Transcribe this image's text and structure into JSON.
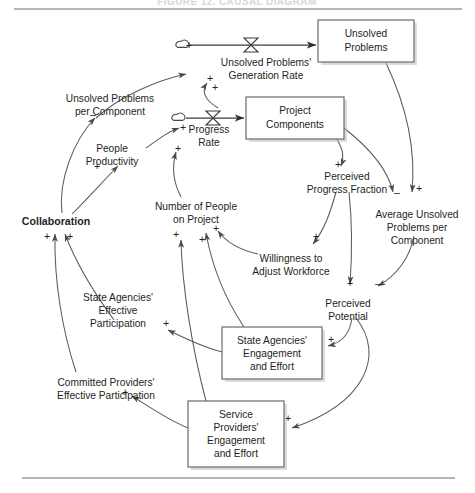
{
  "figure": {
    "title": "FIGURE 12. CAUSAL DIAGRAM",
    "top_rule": true,
    "bottom_rule": true,
    "type": "causal-loop-diagram"
  },
  "stocks": [
    {
      "id": "unsolved_problems",
      "lines": [
        "Unsolved",
        "Problems"
      ],
      "x": 318,
      "y": 20,
      "w": 96,
      "h": 42
    },
    {
      "id": "project_components",
      "lines": [
        "Project",
        "Components"
      ],
      "x": 246,
      "y": 97,
      "w": 98,
      "h": 42
    },
    {
      "id": "state_agencies_engagement",
      "lines": [
        "State Agencies'",
        "Engagement",
        "and Effort"
      ],
      "x": 222,
      "y": 327,
      "w": 100,
      "h": 52
    },
    {
      "id": "service_providers_engagement",
      "lines": [
        "Service",
        "Providers'",
        "Engagement",
        "and Effort"
      ],
      "x": 188,
      "y": 401,
      "w": 96,
      "h": 66
    }
  ],
  "flows": [
    {
      "id": "unsolved_problems_generation_rate",
      "lines": [
        "Unsolved Problems'",
        "Generation Rate"
      ],
      "label_x": 266,
      "label_y": 65,
      "cloud_x": 180,
      "cloud_y": 45,
      "valve_x": 251,
      "valve_y": 45,
      "target": "unsolved_problems"
    },
    {
      "id": "progress_rate",
      "lines": [
        "Progress",
        "Rate"
      ],
      "label_x": 209,
      "label_y": 132,
      "cloud_x": 176,
      "cloud_y": 118,
      "valve_x": 213,
      "valve_y": 118,
      "target": "project_components"
    }
  ],
  "variables": [
    {
      "id": "unsolved_problems_per_component",
      "lines": [
        "Unsolved Problems",
        "per Component"
      ],
      "x": 110,
      "y": 98,
      "bold": false
    },
    {
      "id": "people_productivity",
      "lines": [
        "People",
        "Productivity"
      ],
      "x": 112,
      "y": 148,
      "bold": false
    },
    {
      "id": "collaboration",
      "lines": [
        "Collaboration"
      ],
      "x": 56,
      "y": 221,
      "bold": true
    },
    {
      "id": "number_of_people_on_project",
      "lines": [
        "Number of People",
        "on Project"
      ],
      "x": 196,
      "y": 206,
      "bold": false
    },
    {
      "id": "willingness_to_adjust_workforce",
      "lines": [
        "Willingness to",
        "Adjust Workforce"
      ],
      "x": 291,
      "y": 258,
      "bold": false
    },
    {
      "id": "perceived_progress_fraction",
      "lines": [
        "Perceived",
        "Progress Fraction"
      ],
      "x": 347,
      "y": 176,
      "bold": false
    },
    {
      "id": "average_unsolved_problems_per_component",
      "lines": [
        "Average Unsolved",
        "Problems per",
        "Component"
      ],
      "x": 417,
      "y": 214,
      "bold": false
    },
    {
      "id": "perceived_potential",
      "lines": [
        "Perceived",
        "Potential"
      ],
      "x": 348,
      "y": 303,
      "bold": false
    },
    {
      "id": "state_agencies_effective_participation",
      "lines": [
        "State Agencies'",
        "Effective",
        "Participation"
      ],
      "x": 118,
      "y": 297,
      "bold": false
    },
    {
      "id": "committed_providers_effective_participation",
      "lines": [
        "Committed Providers'",
        "Effective Participation"
      ],
      "x": 106,
      "y": 382,
      "bold": false
    }
  ],
  "polarity_marks": [
    {
      "id": "p-upg-cloud",
      "sign": "+",
      "x": 189,
      "y": 49
    },
    {
      "id": "p-upc-to-upgr",
      "sign": "+",
      "x": 210,
      "y": 82
    },
    {
      "id": "p-pc-to-upgr",
      "sign": "+",
      "x": 215,
      "y": 91
    },
    {
      "id": "p-prodrate",
      "sign": "+",
      "x": 183,
      "y": 131
    },
    {
      "id": "p-nop-to-progress",
      "sign": "+",
      "x": 178,
      "y": 152
    },
    {
      "id": "p-upc-neg",
      "sign": "–",
      "x": 93,
      "y": 118
    },
    {
      "id": "p-collab-prod",
      "sign": "+",
      "x": 97,
      "y": 170
    },
    {
      "id": "p-collab-left",
      "sign": "+",
      "x": 47,
      "y": 240
    },
    {
      "id": "p-collab-right",
      "sign": "+",
      "x": 70,
      "y": 240
    },
    {
      "id": "p-nop-a",
      "sign": "+",
      "x": 176,
      "y": 238
    },
    {
      "id": "p-nop-b",
      "sign": "+",
      "x": 202,
      "y": 243
    },
    {
      "id": "p-nop-c",
      "sign": "+",
      "x": 216,
      "y": 232
    },
    {
      "id": "p-ppf",
      "sign": "+",
      "x": 338,
      "y": 168
    },
    {
      "id": "p-wtaw",
      "sign": "+",
      "x": 316,
      "y": 240
    },
    {
      "id": "p-aupc-neg",
      "sign": "–",
      "x": 397,
      "y": 196
    },
    {
      "id": "p-aupc-pos",
      "sign": "+",
      "x": 419,
      "y": 192
    },
    {
      "id": "p-pp-plus",
      "sign": "+",
      "x": 350,
      "y": 287
    },
    {
      "id": "p-pp-neg",
      "sign": "–",
      "x": 378,
      "y": 287
    },
    {
      "id": "p-sae-plus",
      "sign": "+",
      "x": 331,
      "y": 343
    },
    {
      "id": "p-spe-plus",
      "sign": "+",
      "x": 288,
      "y": 422
    },
    {
      "id": "p-saep",
      "sign": "+",
      "x": 166,
      "y": 327
    },
    {
      "id": "p-cpep",
      "sign": "+",
      "x": 125,
      "y": 396
    }
  ],
  "links": [
    {
      "id": "link-upc-to-upgr",
      "from": "unsolved_problems_per_component",
      "to": "unsolved_problems_generation_rate",
      "sign": "+"
    },
    {
      "id": "link-pc-to-upgr",
      "from": "project_components",
      "to": "unsolved_problems_generation_rate",
      "sign": "+"
    },
    {
      "id": "link-up-to-aupc",
      "from": "unsolved_problems",
      "to": "average_unsolved_problems_per_component",
      "sign": "+"
    },
    {
      "id": "link-pc-to-ppf",
      "from": "project_components",
      "to": "perceived_progress_fraction",
      "sign": "+"
    },
    {
      "id": "link-pc-to-aupc",
      "from": "project_components",
      "to": "average_unsolved_problems_per_component",
      "sign": "–"
    },
    {
      "id": "link-prod-to-progress",
      "from": "people_productivity",
      "to": "progress_rate",
      "sign": "+"
    },
    {
      "id": "link-nop-to-progress",
      "from": "number_of_people_on_project",
      "to": "progress_rate",
      "sign": "+"
    },
    {
      "id": "link-collab-to-upc",
      "from": "collaboration",
      "to": "unsolved_problems_per_component",
      "sign": "–"
    },
    {
      "id": "link-collab-to-prod",
      "from": "collaboration",
      "to": "people_productivity",
      "sign": "+"
    },
    {
      "id": "link-saep-to-collab",
      "from": "state_agencies_effective_participation",
      "to": "collaboration",
      "sign": "+"
    },
    {
      "id": "link-cpep-to-collab",
      "from": "committed_providers_effective_participation",
      "to": "collaboration",
      "sign": "+"
    },
    {
      "id": "link-wtaw-to-nop",
      "from": "willingness_to_adjust_workforce",
      "to": "number_of_people_on_project",
      "sign": "+"
    },
    {
      "id": "link-ppf-to-wtaw",
      "from": "perceived_progress_fraction",
      "to": "willingness_to_adjust_workforce",
      "sign": "+"
    },
    {
      "id": "link-ppf-to-pp",
      "from": "perceived_progress_fraction",
      "to": "perceived_potential",
      "sign": "+"
    },
    {
      "id": "link-aupc-to-pp",
      "from": "average_unsolved_problems_per_component",
      "to": "perceived_potential",
      "sign": "–"
    },
    {
      "id": "link-pp-to-sae",
      "from": "perceived_potential",
      "to": "state_agencies_engagement",
      "sign": "+"
    },
    {
      "id": "link-pp-to-spe",
      "from": "perceived_potential",
      "to": "service_providers_engagement",
      "sign": "+"
    },
    {
      "id": "link-sae-to-saep",
      "from": "state_agencies_engagement",
      "to": "state_agencies_effective_participation",
      "sign": "+"
    },
    {
      "id": "link-spe-to-cpep",
      "from": "service_providers_engagement",
      "to": "committed_providers_effective_participation",
      "sign": "+"
    },
    {
      "id": "link-sae-to-nop",
      "from": "state_agencies_engagement",
      "to": "number_of_people_on_project",
      "sign": "+"
    },
    {
      "id": "link-spe-to-nop",
      "from": "service_providers_engagement",
      "to": "number_of_people_on_project",
      "sign": "+"
    }
  ]
}
